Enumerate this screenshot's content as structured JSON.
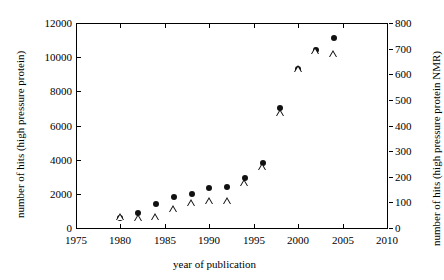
{
  "chart_data": {
    "type": "scatter",
    "title": "",
    "xlabel": "year of publication",
    "ylabel_left": "number of hits (high pressure protein)",
    "ylabel_right": "number of hits (high pressure protein NMR)",
    "xlim": [
      1975,
      2010
    ],
    "ylim_left": [
      0,
      12000
    ],
    "ylim_right": [
      0,
      800
    ],
    "xticks": [
      1975,
      1980,
      1985,
      1990,
      1995,
      2000,
      2005,
      2010
    ],
    "yticks_left": [
      0,
      2000,
      4000,
      6000,
      8000,
      10000,
      12000
    ],
    "yticks_right": [
      0,
      100,
      200,
      300,
      400,
      500,
      600,
      700,
      800
    ],
    "grid": false,
    "legend": "none",
    "x": [
      1980,
      1982,
      1984,
      1986,
      1988,
      1990,
      1992,
      1994,
      1996,
      1998,
      2000,
      2002,
      2004
    ],
    "series": [
      {
        "name": "number of hits (high pressure protein)",
        "marker": "filled-circle",
        "axis": "left",
        "values": [
          600,
          900,
          1400,
          1800,
          2000,
          2350,
          2400,
          2950,
          3800,
          7000,
          9300,
          10400,
          11150
        ]
      },
      {
        "name": "number of hits (high pressure protein NMR)",
        "marker": "open-triangle",
        "axis": "right",
        "values": [
          45,
          40,
          45,
          75,
          100,
          105,
          105,
          175,
          240,
          450,
          620,
          690,
          680
        ]
      }
    ]
  }
}
